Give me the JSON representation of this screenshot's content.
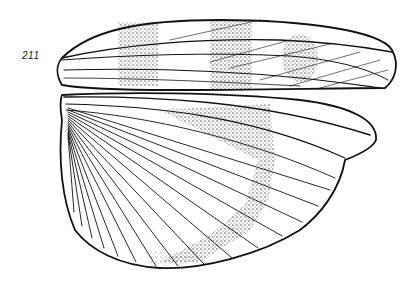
{
  "figure": {
    "label": "211",
    "colors": {
      "ink": "#111111",
      "background": "#ffffff",
      "stipple": "#222222"
    }
  }
}
